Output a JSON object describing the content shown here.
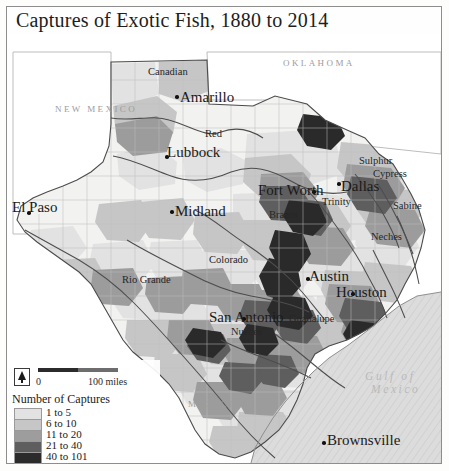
{
  "title": "Captures of Exotic Fish, 1880 to 2014",
  "map": {
    "cities": [
      {
        "name": "Amarillo",
        "x": 175,
        "y": 97,
        "size": "lg"
      },
      {
        "name": "Lubbock",
        "x": 162,
        "y": 148,
        "size": "lg"
      },
      {
        "name": "El Paso",
        "x": 9,
        "y": 200,
        "size": "lg"
      },
      {
        "name": "Midland",
        "x": 170,
        "y": 207,
        "size": "lg"
      },
      {
        "name": "Fort Worth",
        "x": 258,
        "y": 187,
        "size": "lg"
      },
      {
        "name": "Dallas",
        "x": 335,
        "y": 183,
        "size": "lg"
      },
      {
        "name": "Austin",
        "x": 305,
        "y": 268,
        "size": "lg"
      },
      {
        "name": "Houston",
        "x": 333,
        "y": 287,
        "size": "lg"
      },
      {
        "name": "San Antonio",
        "x": 207,
        "y": 310,
        "size": "lg"
      },
      {
        "name": "Brownsville",
        "x": 313,
        "y": 432,
        "size": "lg"
      }
    ],
    "city_dots": [
      {
        "x": 168,
        "y": 95
      },
      {
        "x": 158,
        "y": 155
      },
      {
        "x": 20,
        "y": 211
      },
      {
        "x": 163,
        "y": 210
      },
      {
        "x": 305,
        "y": 190
      },
      {
        "x": 330,
        "y": 182
      },
      {
        "x": 299,
        "y": 277
      },
      {
        "x": 344,
        "y": 292
      },
      {
        "x": 235,
        "y": 317
      },
      {
        "x": 315,
        "y": 441
      }
    ],
    "rivers": [
      {
        "name": "Canadian",
        "x": 148,
        "y": 66
      },
      {
        "name": "Red",
        "x": 205,
        "y": 128
      },
      {
        "name": "Brazos",
        "x": 269,
        "y": 209
      },
      {
        "name": "Trinity",
        "x": 322,
        "y": 196
      },
      {
        "name": "Sulphur",
        "x": 359,
        "y": 155
      },
      {
        "name": "Cypress",
        "x": 373,
        "y": 168
      },
      {
        "name": "Sabine",
        "x": 393,
        "y": 200
      },
      {
        "name": "Neches",
        "x": 371,
        "y": 231
      },
      {
        "name": "Colorado",
        "x": 209,
        "y": 254
      },
      {
        "name": "Rio Grande",
        "x": 122,
        "y": 274
      },
      {
        "name": "Guadalupe",
        "x": 289,
        "y": 313
      },
      {
        "name": "Nueces",
        "x": 231,
        "y": 326
      }
    ],
    "regions": [
      {
        "name": "NEW MEXICO",
        "x": 55,
        "y": 104
      },
      {
        "name": "OKLAHOMA",
        "x": 283,
        "y": 58
      },
      {
        "name": "MEXICO",
        "x": 188,
        "y": 399
      }
    ],
    "waters": [
      {
        "name": "Gulf of",
        "x": 365,
        "y": 370
      },
      {
        "name": "Mexico",
        "x": 371,
        "y": 383
      }
    ]
  },
  "scale": {
    "zero_label": "0",
    "end_label": "100 miles"
  },
  "legend": {
    "title": "Number of Captures",
    "classes": [
      {
        "label": "1 to 5",
        "color": "#e2e2e2"
      },
      {
        "label": "6 to 10",
        "color": "#c3c3c3"
      },
      {
        "label": "11 to 20",
        "color": "#9a9a9a"
      },
      {
        "label": "21 to 40",
        "color": "#5c5c5c"
      },
      {
        "label": "40 to 101",
        "color": "#2d2d2d"
      }
    ]
  }
}
